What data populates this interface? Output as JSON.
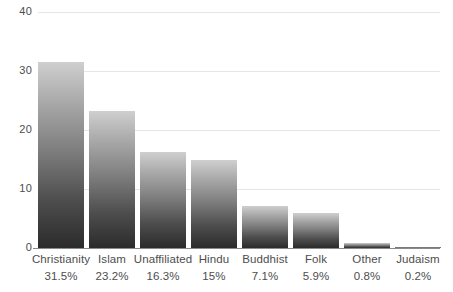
{
  "chart_data": {
    "type": "bar",
    "title": "",
    "subtitle": "",
    "xlabel": "",
    "ylabel": "",
    "categories": [
      "Christianity",
      "Islam",
      "Unaffiliated",
      "Hindu",
      "Buddhist",
      "Folk",
      "Other",
      "Judaism"
    ],
    "values": [
      31.5,
      23.2,
      16.3,
      15,
      7.1,
      5.9,
      0.8,
      0.2
    ],
    "value_labels": [
      "31.5%",
      "23.2%",
      "16.3%",
      "15%",
      "7.1%",
      "5.9%",
      "0.8%",
      "0.2%"
    ],
    "ylim": [
      0,
      40
    ],
    "ytick_labels": [
      "0",
      "10",
      "20",
      "30",
      "40"
    ],
    "ytick_values": [
      0,
      10,
      20,
      30,
      40
    ],
    "grid": true,
    "legend": "none",
    "series": [
      {
        "name": "Share of world population",
        "values": [
          31.5,
          23.2,
          16.3,
          15,
          7.1,
          5.9,
          0.8,
          0.2
        ]
      }
    ],
    "colors": {
      "bar_gradient_top": "#cfcfcf",
      "bar_gradient_bottom": "#2b2b2b",
      "gridline": "#e6e6e6",
      "axis_line": "#8a8a8a",
      "label_text": "#4d4d4d",
      "background": "#ffffff"
    }
  },
  "axis": {
    "y_ticks": [
      {
        "label": "40",
        "value": 40
      },
      {
        "label": "30",
        "value": 30
      },
      {
        "label": "20",
        "value": 20
      },
      {
        "label": "10",
        "value": 10
      },
      {
        "label": "0",
        "value": 0
      }
    ]
  },
  "bars": [
    {
      "name": "Christianity",
      "value": 31.5,
      "value_label": "31.5%"
    },
    {
      "name": "Islam",
      "value": 23.2,
      "value_label": "23.2%"
    },
    {
      "name": "Unaffiliated",
      "value": 16.3,
      "value_label": "16.3%"
    },
    {
      "name": "Hindu",
      "value": 15,
      "value_label": "15%"
    },
    {
      "name": "Buddhist",
      "value": 7.1,
      "value_label": "7.1%"
    },
    {
      "name": "Folk",
      "value": 5.9,
      "value_label": "5.9%"
    },
    {
      "name": "Other",
      "value": 0.8,
      "value_label": "0.8%"
    },
    {
      "name": "Judaism",
      "value": 0.2,
      "value_label": "0.2%"
    }
  ]
}
